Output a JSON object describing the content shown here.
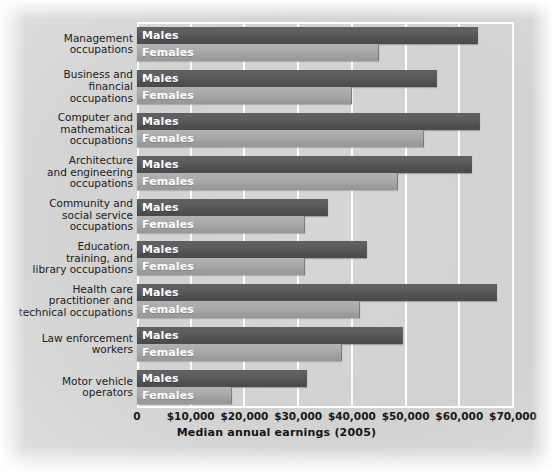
{
  "chart_data": {
    "type": "bar",
    "orientation": "horizontal",
    "title": "",
    "xlabel": "Median annual earnings (2005)",
    "ylabel": "",
    "xlim": [
      0,
      70000
    ],
    "xticks": [
      0,
      10000,
      20000,
      30000,
      40000,
      50000,
      60000,
      70000
    ],
    "xticklabels": [
      "0",
      "$10,000",
      "$20,000",
      "$30,000",
      "$40,000",
      "$50,000",
      "$60,000",
      "$70,000"
    ],
    "grid": true,
    "legend": "in-bar labels",
    "categories": [
      "Management\noccupations",
      "Business and\nfinancial\noccupations",
      "Computer and\nmathematical\noccupations",
      "Architecture\nand engineering\noccupations",
      "Community and\nsocial service\noccupations",
      "Education,\ntraining, and\nlibrary occupations",
      "Health care\npractitioner and\ntechnical occupations",
      "Law enforcement\nworkers",
      "Motor vehicle\noperators"
    ],
    "series": [
      {
        "name": "Males",
        "color": "#565656",
        "values": [
          63500,
          55800,
          63800,
          62300,
          35500,
          42800,
          67000,
          49500,
          31600
        ]
      },
      {
        "name": "Females",
        "color": "#a4a4a4",
        "values": [
          45000,
          40000,
          53500,
          48500,
          31200,
          31300,
          41500,
          38200,
          17700
        ]
      }
    ]
  },
  "colors": {
    "males_bar": "#565656",
    "females_bar": "#a4a4a4",
    "gridline": "#ffffff",
    "plot_background": "#d4d4d4",
    "text": "#1b1b1b"
  }
}
